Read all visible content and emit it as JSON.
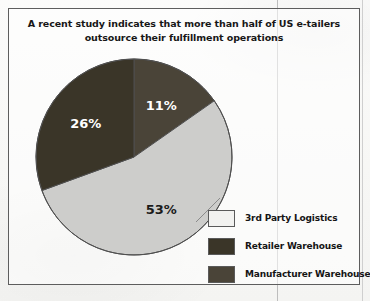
{
  "chart_data": {
    "type": "pie",
    "title": "A recent study indicates that more than half of US e-tailers outsource their fulfillment operations",
    "title_line_1": "A recent study indicates that more than half of US e-tailers",
    "title_line_2": "outsource their fulfillment operations",
    "categories": [
      "3rd Party Logistics",
      "Retailer Warehouse",
      "Manufacturer Warehouse"
    ],
    "values": [
      53,
      26,
      11
    ],
    "value_labels": [
      "53%",
      "26%",
      "11%"
    ],
    "unit": "%",
    "legend_position": "bottom-right",
    "grid": false,
    "slices": [
      {
        "label": "Manufacturer Warehouse",
        "value": 11,
        "value_label": "11%",
        "color": "#4a4438",
        "label_color": "#ffffff",
        "start_angle": 0,
        "end_angle": 55
      },
      {
        "label": "3rd Party Logistics",
        "value": 53,
        "value_label": "53%",
        "color": "#cdcdcb",
        "label_color": "#1b1b1b",
        "start_angle": 55,
        "end_angle": 250
      },
      {
        "label": "Retailer Warehouse",
        "value": 26,
        "value_label": "26%",
        "color": "#3a3528",
        "label_color": "#ffffff",
        "start_angle": 250,
        "end_angle": 360
      }
    ]
  },
  "legend": {
    "items": [
      {
        "label": "3rd Party Logistics",
        "color": "#f2f2f0"
      },
      {
        "label": "Retailer Warehouse",
        "color": "#3a3528"
      },
      {
        "label": "Manufacturer Warehouse",
        "color": "#4a4438"
      }
    ]
  },
  "colors": {
    "frame_border": "#5d5d5d",
    "paper": "#f7f7f5",
    "text": "#171717"
  }
}
